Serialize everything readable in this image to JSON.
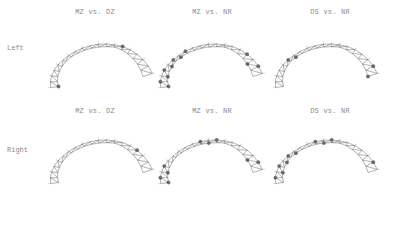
{
  "figure": {
    "rows": [
      {
        "label": "Left"
      },
      {
        "label": "Right"
      }
    ],
    "columns": [
      {
        "title": "MZ vs. DZ"
      },
      {
        "title": "MZ vs. NR"
      },
      {
        "title": "DS vs. NR"
      }
    ],
    "panels": [
      {
        "row": "Left",
        "comparison": "MZ vs. DZ",
        "significant_density": "low"
      },
      {
        "row": "Left",
        "comparison": "MZ vs. NR",
        "significant_density": "high"
      },
      {
        "row": "Left",
        "comparison": "DS vs. NR",
        "significant_density": "low"
      },
      {
        "row": "Right",
        "comparison": "MZ vs. DZ",
        "significant_density": "low"
      },
      {
        "row": "Right",
        "comparison": "MZ vs. NR",
        "significant_density": "high"
      },
      {
        "row": "Right",
        "comparison": "DS vs. NR",
        "significant_density": "medium"
      }
    ],
    "colors": {
      "mesh": "#555555",
      "significant_marker": "#6a6a6a",
      "text": "#8a8a8a"
    }
  }
}
